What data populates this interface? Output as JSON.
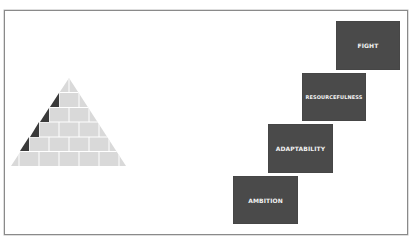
{
  "diagram": {
    "pyramid": {
      "rows": 6,
      "apex": [
        69,
        78
      ],
      "base_left": [
        11,
        166
      ],
      "base_right": [
        126,
        166
      ],
      "brick_color": "#d9d9d9",
      "mortar_color": "#ffffff",
      "accent_color": "#3a3a3a",
      "accent_rows": [
        1,
        2,
        3,
        4
      ]
    },
    "steps": [
      {
        "label": "AMBITION",
        "x": 233,
        "y": 176,
        "w": 65,
        "h": 48
      },
      {
        "label": "ADAPTABILITY",
        "x": 268,
        "y": 124,
        "w": 65,
        "h": 49
      },
      {
        "label": "RESOURCEFULNESS",
        "x": 302,
        "y": 73,
        "w": 64,
        "h": 48
      },
      {
        "label": "FIGHT",
        "x": 336,
        "y": 21,
        "w": 64,
        "h": 49
      }
    ],
    "step_color": "#4a4a4a",
    "text_color": "#f2f2f2"
  }
}
